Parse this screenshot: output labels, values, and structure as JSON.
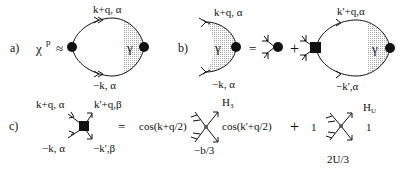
{
  "panels": {
    "a": {
      "label": "a)",
      "lhs": "χ",
      "lhs_sup": "p",
      "approx": "≈",
      "top_label": "k+q, α",
      "bottom_label": "−k, α",
      "vertex_label": "γ"
    },
    "b": {
      "label": "b)",
      "top_label": "k+q, α",
      "bottom_label": "−k, α",
      "vertex_label": "γ",
      "equals": "=",
      "plus": "+",
      "loop_top_label": "k'+q,α",
      "loop_bottom_label": "−k',α",
      "loop_vertex_label": "γ"
    },
    "c": {
      "label": "c)",
      "top_left": "k+q, α",
      "top_right": "k'+q,β",
      "bottom_left": "−k, α",
      "bottom_right": "−k',β",
      "equals": "=",
      "term1_left": "cos(k+q/2)",
      "term1_right": "cos(k'+q/2)",
      "term1_name": "H",
      "term1_name_sub": "3",
      "term1_coeff": "−b/3",
      "plus": "+",
      "term2_left": "1",
      "term2_right": "1",
      "term2_name": "H",
      "term2_name_sub": "U",
      "term2_coeff": "2U/3"
    }
  },
  "colors": {
    "ink": "#111111",
    "hatch": "#b0b0b0",
    "background": "#ffffff"
  }
}
